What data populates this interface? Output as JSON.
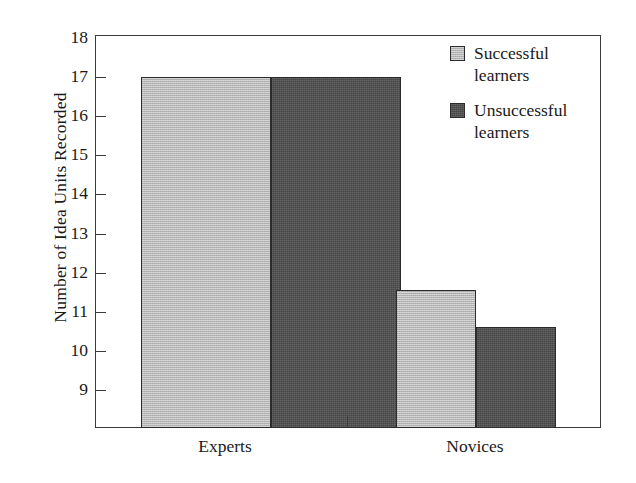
{
  "chart_data": {
    "type": "bar",
    "title": "",
    "xlabel": "",
    "ylabel": "Number of Idea Units Recorded",
    "categories": [
      "Experts",
      "Novices"
    ],
    "series": [
      {
        "name": "Successful learners",
        "color": "#b5b5b5",
        "values": [
          17.0,
          11.55
        ]
      },
      {
        "name": "Unsuccessful learners",
        "color": "#454545",
        "values": [
          17.0,
          10.6
        ]
      }
    ],
    "ylim": [
      8.0,
      18.0
    ],
    "yticks": [
      18,
      17,
      16,
      15,
      14,
      13,
      12,
      11,
      10,
      9
    ],
    "ytick_labels": [
      "18",
      "17",
      "16",
      "15",
      "14",
      "13",
      "12",
      "11",
      "10",
      "9"
    ],
    "grid": false,
    "legend_position": "top-right",
    "axis_color": "#3a3a3a",
    "bar_border_color": "#2b2b2b",
    "background": "#ffffff"
  },
  "legend": {
    "items": [
      {
        "label_line1": "Successful",
        "label_line2": "learners",
        "swatch": "legend-swatch-light"
      },
      {
        "label_line1": "Unsuccessful",
        "label_line2": "learners",
        "swatch": "legend-swatch-dark"
      }
    ]
  }
}
